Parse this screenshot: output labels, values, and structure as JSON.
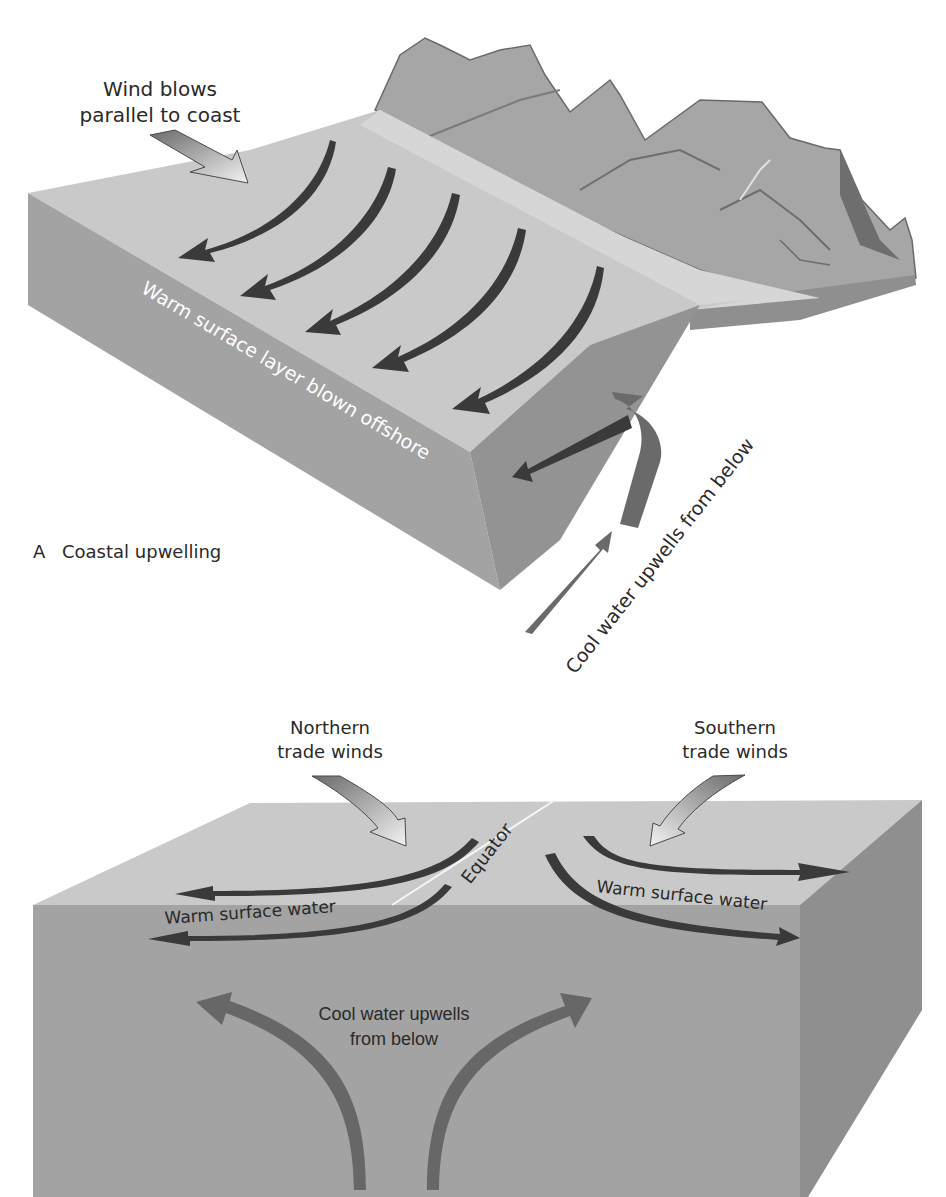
{
  "figure": {
    "panel_a": {
      "caption_letter": "A",
      "caption_title": "Coastal upwelling",
      "wind_label_line1": "Wind blows",
      "wind_label_line2": "parallel to coast",
      "surface_label": "Warm surface layer blown offshore",
      "upwelling_label": "Cool water upwells from below",
      "surface_arrow_count": 5
    },
    "panel_b": {
      "north_wind_line1": "Northern",
      "north_wind_line2": "trade winds",
      "south_wind_line1": "Southern",
      "south_wind_line2": "trade winds",
      "equator_label": "Equator",
      "warm_left_label": "Warm surface water",
      "warm_right_label": "Warm  surface water",
      "cool_label_line1": "Cool water upwells",
      "cool_label_line2": "from below"
    }
  },
  "colors": {
    "background": "#ffffff",
    "top_face": "#c9c9c9",
    "shelf_face": "#d6d6d6",
    "front_face": "#a3a3a3",
    "side_face": "#8f8f8f",
    "mountain": "#a8a8a8",
    "mountain_dark": "#6e6e6e",
    "surface_arrow": "#3a3a3a",
    "deep_arrow": "#676767",
    "text": "#2a2a2a"
  }
}
